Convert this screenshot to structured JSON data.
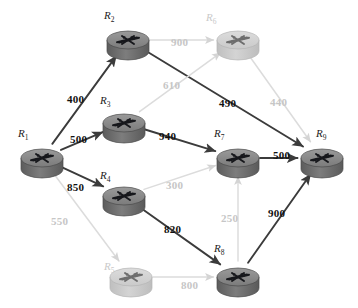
{
  "diagram": {
    "colors": {
      "active_edge": "#3b3b3b",
      "faded_edge": "#dcdcdc",
      "node_top": "#8a8a8a",
      "node_body": "#6f6f6f",
      "node_faded_top": "#d2d2d2",
      "node_faded_body": "#c4c4c4",
      "label_text": "#1c1c1c",
      "faded_text": "#c9c9c9"
    },
    "nodes": [
      {
        "id": "R1",
        "label": "R",
        "sub": "1",
        "x": 42,
        "y": 158,
        "state": "active",
        "label_x": 18,
        "label_y": 128
      },
      {
        "id": "R2",
        "label": "R",
        "sub": "2",
        "x": 128,
        "y": 40,
        "state": "active",
        "label_x": 104,
        "label_y": 10
      },
      {
        "id": "R3",
        "label": "R",
        "sub": "3",
        "x": 124,
        "y": 123,
        "state": "active",
        "label_x": 100,
        "label_y": 95
      },
      {
        "id": "R4",
        "label": "R",
        "sub": "4",
        "x": 124,
        "y": 196,
        "state": "active",
        "label_x": 100,
        "label_y": 170
      },
      {
        "id": "R5",
        "label": "R",
        "sub": "5",
        "x": 131,
        "y": 277,
        "state": "faded",
        "label_x": 104,
        "label_y": 261
      },
      {
        "id": "R6",
        "label": "R",
        "sub": "6",
        "x": 238,
        "y": 40,
        "state": "faded",
        "label_x": 206,
        "label_y": 12
      },
      {
        "id": "R7",
        "label": "R",
        "sub": "7",
        "x": 238,
        "y": 158,
        "state": "active",
        "label_x": 214,
        "label_y": 128
      },
      {
        "id": "R8",
        "label": "R",
        "sub": "8",
        "x": 238,
        "y": 277,
        "state": "active",
        "label_x": 214,
        "label_y": 243
      },
      {
        "id": "R9",
        "label": "R",
        "sub": "9",
        "x": 322,
        "y": 158,
        "state": "active",
        "label_x": 316,
        "label_y": 128
      }
    ],
    "edges": [
      {
        "from": "R1",
        "to": "R2",
        "weight": "400",
        "state": "active",
        "label_x": 67,
        "label_y": 94
      },
      {
        "from": "R1",
        "to": "R3",
        "weight": "500",
        "state": "active",
        "label_x": 70,
        "label_y": 134
      },
      {
        "from": "R1",
        "to": "R4",
        "weight": "850",
        "state": "active",
        "label_x": 67,
        "label_y": 182
      },
      {
        "from": "R1",
        "to": "R5",
        "weight": "550",
        "state": "faded",
        "label_x": 51,
        "label_y": 216
      },
      {
        "from": "R2",
        "to": "R6",
        "weight": "900",
        "state": "faded",
        "label_x": 171,
        "label_y": 37
      },
      {
        "from": "R2",
        "to": "R9",
        "weight": "490",
        "state": "active",
        "label_x": 219,
        "label_y": 98
      },
      {
        "from": "R3",
        "to": "R6",
        "weight": "610",
        "state": "faded",
        "label_x": 163,
        "label_y": 80
      },
      {
        "from": "R3",
        "to": "R7",
        "weight": "940",
        "state": "active",
        "label_x": 159,
        "label_y": 131
      },
      {
        "from": "R4",
        "to": "R7",
        "weight": "300",
        "state": "faded",
        "label_x": 166,
        "label_y": 180
      },
      {
        "from": "R4",
        "to": "R8",
        "weight": "820",
        "state": "active",
        "label_x": 164,
        "label_y": 224
      },
      {
        "from": "R5",
        "to": "R8",
        "weight": "800",
        "state": "faded",
        "label_x": 181,
        "label_y": 280
      },
      {
        "from": "R6",
        "to": "R9",
        "weight": "440",
        "state": "faded",
        "label_x": 270,
        "label_y": 97
      },
      {
        "from": "R7",
        "to": "R9",
        "weight": "500",
        "state": "active",
        "label_x": 273,
        "label_y": 150
      },
      {
        "from": "R8",
        "to": "R7",
        "weight": "250",
        "state": "faded",
        "label_x": 221,
        "label_y": 213
      },
      {
        "from": "R8",
        "to": "R9",
        "weight": "900",
        "state": "active",
        "label_x": 268,
        "label_y": 208
      }
    ]
  }
}
